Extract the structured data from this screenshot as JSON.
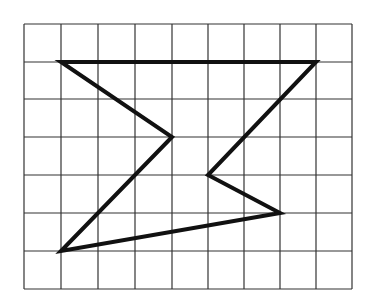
{
  "diagram": {
    "type": "grid-polygon",
    "grid": {
      "columns": 9,
      "rows": 7,
      "x_lines": [
        24,
        61,
        98,
        135,
        172,
        208,
        244,
        280,
        316,
        352
      ],
      "y_lines": [
        24,
        62,
        99,
        137,
        175,
        213,
        251,
        289
      ],
      "line_color": "#333333",
      "line_width": 1.2
    },
    "polygon": {
      "grid_vertices": [
        [
          1,
          1
        ],
        [
          8,
          1
        ],
        [
          5,
          4
        ],
        [
          7,
          5
        ],
        [
          1,
          6
        ],
        [
          4,
          3
        ]
      ],
      "points": "61,62 316,62 208,175 280,213 61,251 172,137",
      "stroke": "#111111",
      "stroke_width": 4
    }
  }
}
